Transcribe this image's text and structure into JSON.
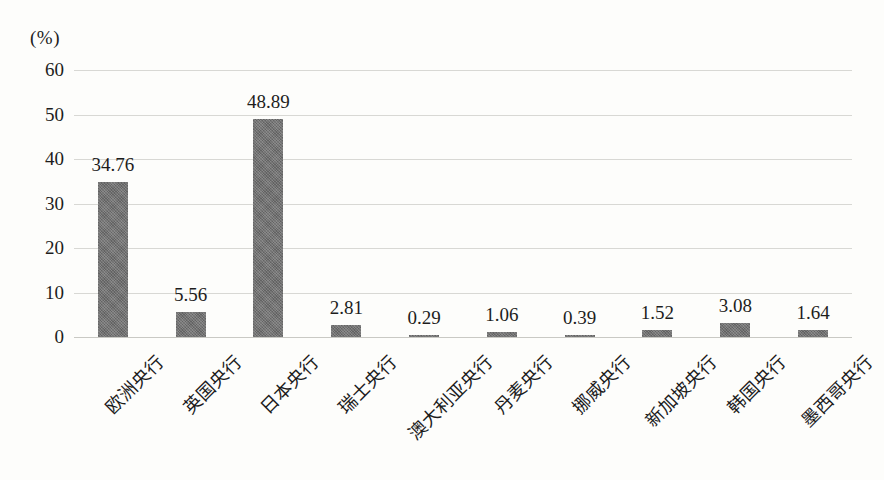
{
  "chart_data": {
    "type": "bar",
    "title": "",
    "subtitle": "",
    "xlabel": "",
    "ylabel": "",
    "unit_label": "(%)",
    "ylim": [
      0,
      60
    ],
    "ytick_values": [
      0,
      10,
      20,
      30,
      40,
      50,
      60
    ],
    "ytick_labels": [
      "0",
      "10",
      "20",
      "30",
      "40",
      "50",
      "60"
    ],
    "grid": true,
    "legend": false,
    "legend_position": "none",
    "categories": [
      "欧洲央行",
      "英国央行",
      "日本央行",
      "瑞士央行",
      "澳大利亚央行",
      "丹麦央行",
      "挪威央行",
      "新加坡央行",
      "韩国央行",
      "墨西哥央行"
    ],
    "values": [
      34.76,
      5.56,
      48.89,
      2.81,
      0.29,
      1.06,
      0.39,
      1.52,
      3.08,
      1.64
    ],
    "value_labels": [
      "34.76",
      "5.56",
      "48.89",
      "2.81",
      "0.29",
      "1.06",
      "0.39",
      "1.52",
      "3.08",
      "1.64"
    ],
    "bar_color": "#6e6e6e",
    "background_color": "#fdfdfb",
    "gridline_color": "#d8d8d4"
  }
}
